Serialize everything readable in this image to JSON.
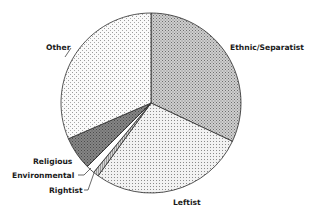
{
  "chart_data": {
    "type": "pie",
    "title": "",
    "start_angle_deg": 0,
    "direction": "clockwise",
    "categories": [
      "Ethnic/Separatist",
      "Leftist",
      "Rightist",
      "Environmental",
      "Religious",
      "Other"
    ],
    "values": [
      32,
      28,
      1,
      1.5,
      6,
      31.5
    ],
    "unit": "percent (estimated)",
    "slices": [
      {
        "label": "Ethnic/Separatist",
        "value": 32,
        "fill": "#b8b8b8",
        "pattern": "dense-dots"
      },
      {
        "label": "Leftist",
        "value": 28,
        "fill": "#e4e4e4",
        "pattern": "fine-dots"
      },
      {
        "label": "Rightist",
        "value": 1,
        "fill": "#c8c8c8",
        "pattern": "stripes"
      },
      {
        "label": "Environmental",
        "value": 1.5,
        "fill": "#ffffff",
        "pattern": "none"
      },
      {
        "label": "Religious",
        "value": 6,
        "fill": "#7a7a7a",
        "pattern": "dark-dots"
      },
      {
        "label": "Other",
        "value": 31.5,
        "fill": "#ececec",
        "pattern": "sparse-dots"
      }
    ],
    "legend": "none (direct labels)",
    "label_positions": {
      "Ethnic/Separatist": [
        230,
        50
      ],
      "Leftist": [
        173,
        205
      ],
      "Rightist": [
        49,
        193
      ],
      "Environmental": [
        12,
        178
      ],
      "Religious": [
        33,
        164
      ],
      "Other": [
        46,
        50
      ]
    },
    "leader_lines": [
      "Environmental",
      "Rightist",
      "Other"
    ]
  }
}
